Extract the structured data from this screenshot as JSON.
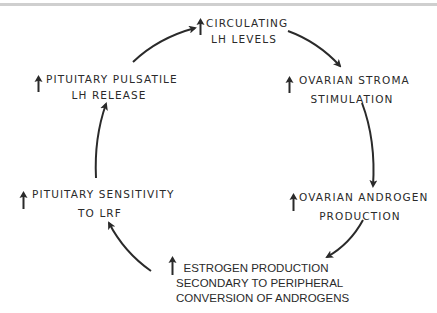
{
  "diagram": {
    "type": "cycle",
    "colors": {
      "ink": "#2a2a2a",
      "background": "#ffffff",
      "top_rule": "#cfcfcf"
    },
    "indicator_icon": "up-arrow-icon",
    "nodes": [
      {
        "id": "circulating-lh",
        "lines": [
          "CIRCULATING",
          "LH LEVELS"
        ],
        "indicator": "increase"
      },
      {
        "id": "ovarian-stroma",
        "lines": [
          "OVARIAN STROMA",
          "STIMULATION"
        ],
        "indicator": "increase"
      },
      {
        "id": "ovarian-androgen",
        "lines": [
          "OVARIAN ANDROGEN",
          "PRODUCTION"
        ],
        "indicator": "increase"
      },
      {
        "id": "estrogen-production",
        "lines": [
          "ESTROGEN PRODUCTION",
          "SECONDARY TO PERIPHERAL",
          "CONVERSION OF ANDROGENS"
        ],
        "indicator": "increase"
      },
      {
        "id": "pituitary-sensitivity",
        "lines": [
          "PITUITARY SENSITIVITY",
          "TO LRF"
        ],
        "indicator": "increase"
      },
      {
        "id": "pituitary-pulsatile",
        "lines": [
          "PITUITARY PULSATILE",
          "LH RELEASE"
        ],
        "indicator": "increase"
      }
    ],
    "edges": [
      {
        "from": "circulating-lh",
        "to": "ovarian-stroma"
      },
      {
        "from": "ovarian-stroma",
        "to": "ovarian-androgen"
      },
      {
        "from": "ovarian-androgen",
        "to": "estrogen-production"
      },
      {
        "from": "estrogen-production",
        "to": "pituitary-sensitivity"
      },
      {
        "from": "pituitary-sensitivity",
        "to": "pituitary-pulsatile"
      },
      {
        "from": "pituitary-pulsatile",
        "to": "circulating-lh"
      }
    ]
  }
}
